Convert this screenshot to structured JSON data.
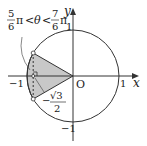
{
  "diagram": {
    "title_condition": {
      "num1": "5",
      "den1": "6",
      "pi": "π",
      "lt": "<",
      "theta": "θ",
      "num2": "7",
      "den2": "6"
    },
    "axes": {
      "x_label": "x",
      "y_label": "y",
      "origin_label": "O"
    },
    "ticks": {
      "x_pos": "1",
      "x_neg": "−1",
      "y_pos": "1",
      "y_neg": "−1"
    },
    "annotation": {
      "minus": "−",
      "sqrt_num": "√3",
      "den": "2"
    },
    "colors": {
      "shade": "#c8c8c8",
      "line": "#333333"
    }
  }
}
